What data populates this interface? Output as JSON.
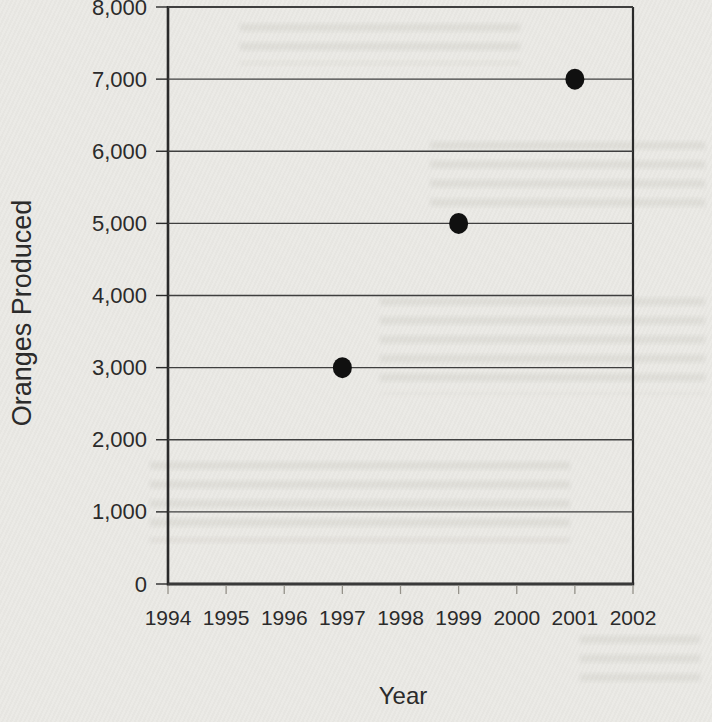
{
  "page": {
    "background_color": "#e9e8e4"
  },
  "chart_data": {
    "type": "scatter",
    "title": "",
    "xlabel": "Year",
    "ylabel": "Oranges Produced",
    "xlim": [
      1994,
      2002
    ],
    "ylim": [
      0,
      8000
    ],
    "x_tick_values": [
      1994,
      1995,
      1996,
      1997,
      1998,
      1999,
      2000,
      2001,
      2002
    ],
    "x_tick_labels": [
      "1994",
      "1995",
      "1996",
      "1997",
      "1998",
      "1999",
      "2000",
      "2001",
      "2002"
    ],
    "y_tick_values": [
      0,
      1000,
      2000,
      3000,
      4000,
      5000,
      6000,
      7000,
      8000
    ],
    "y_tick_labels": [
      "0",
      "1,000",
      "2,000",
      "3,000",
      "4,000",
      "5,000",
      "6,000",
      "7,000",
      "8,000"
    ],
    "grid": "horizontal gridlines at every 1,000, plot framed on left, right, top and bottom",
    "legend_position": "none",
    "series": [
      {
        "name": "Oranges Produced",
        "points": [
          {
            "x": 1997,
            "y": 3000
          },
          {
            "x": 1999,
            "y": 5000
          },
          {
            "x": 2001,
            "y": 7000
          }
        ]
      }
    ],
    "marker": {
      "shape": "filled-circle",
      "color": "#101010"
    },
    "colors": {
      "axis": "#2a2a2a",
      "gridline": "#3f3f3f",
      "tick": "#95928a",
      "text": "#2b2b2b",
      "background": "#e9e8e4"
    }
  }
}
